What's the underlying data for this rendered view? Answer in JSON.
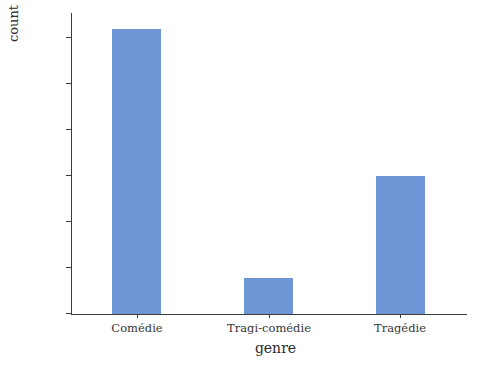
{
  "chart_data": {
    "type": "bar",
    "title": "",
    "xlabel": "genre",
    "ylabel": "count",
    "categories": [
      "Comédie",
      "Tragi-comédie",
      "Tragédie"
    ],
    "values": [
      310,
      39,
      150
    ],
    "ylim": [
      0,
      320
    ],
    "yticks": [
      0,
      50,
      100,
      150,
      200,
      250,
      300
    ],
    "ytick_labels": [
      "0",
      "50",
      "100",
      "150",
      "200",
      "250",
      "300"
    ],
    "grid": false,
    "legend": null,
    "bar_color": "#6e96d6",
    "axis_color": "#3c3c3c",
    "background": "#ffffff"
  },
  "axes": {
    "x_title": "genre",
    "y_title": "count"
  }
}
